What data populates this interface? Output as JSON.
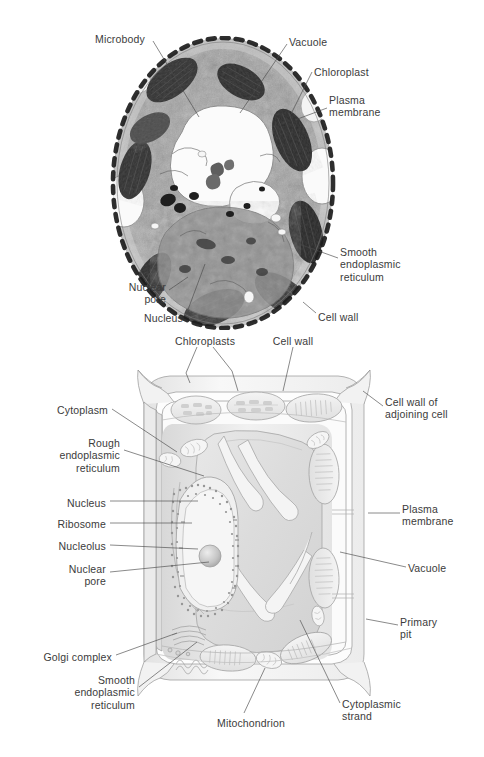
{
  "figure_top": {
    "name": "plant-cell-electron-micrograph",
    "labels": [
      {
        "id": "microbody",
        "text": "Microbody",
        "x": 95,
        "y": 33,
        "align": "left"
      },
      {
        "id": "vacuole",
        "text": "Vacuole",
        "x": 289,
        "y": 36,
        "align": "left"
      },
      {
        "id": "chloroplast",
        "text": "Chloroplast",
        "x": 314,
        "y": 66,
        "align": "left"
      },
      {
        "id": "plasma-membrane",
        "text": "Plasma\nmembrane",
        "x": 329,
        "y": 94,
        "align": "left"
      },
      {
        "id": "smooth-er",
        "text": "Smooth\nendoplasmic\nreticulum",
        "x": 340,
        "y": 246,
        "align": "left"
      },
      {
        "id": "cell-wall",
        "text": "Cell wall",
        "x": 318,
        "y": 311,
        "align": "left"
      },
      {
        "id": "nuclear-pore",
        "text": "Nuclear\npore",
        "x": 166,
        "y": 281,
        "align": "right"
      },
      {
        "id": "nucleus",
        "text": "Nucleus",
        "x": 183,
        "y": 312,
        "align": "right"
      }
    ]
  },
  "figure_bottom": {
    "name": "plant-cell-cutaway-drawing",
    "labels": [
      {
        "id": "chloroplasts",
        "text": "Chloroplasts",
        "x": 205,
        "y": 335,
        "align": "center"
      },
      {
        "id": "cell-wall-top",
        "text": "Cell wall",
        "x": 293,
        "y": 335,
        "align": "center"
      },
      {
        "id": "cytoplasm",
        "text": "Cytoplasm",
        "x": 108,
        "y": 404,
        "align": "right"
      },
      {
        "id": "rough-er",
        "text": "Rough\nendoplasmic\nreticulum",
        "x": 120,
        "y": 437,
        "align": "right"
      },
      {
        "id": "nucleus",
        "text": "Nucleus",
        "x": 106,
        "y": 497,
        "align": "right"
      },
      {
        "id": "ribosome",
        "text": "Ribosome",
        "x": 106,
        "y": 518,
        "align": "right"
      },
      {
        "id": "nucleolus",
        "text": "Nucleolus",
        "x": 106,
        "y": 540,
        "align": "right"
      },
      {
        "id": "nuclear-pore",
        "text": "Nuclear\npore",
        "x": 106,
        "y": 563,
        "align": "right"
      },
      {
        "id": "golgi-complex",
        "text": "Golgi complex",
        "x": 112,
        "y": 651,
        "align": "right"
      },
      {
        "id": "smooth-er",
        "text": "Smooth\nendoplasmic\nreticulum",
        "x": 135,
        "y": 674,
        "align": "right"
      },
      {
        "id": "mitochondrion",
        "text": "Mitochondrion",
        "x": 217,
        "y": 717,
        "align": "left"
      },
      {
        "id": "cytoplasmic-strand",
        "text": "Cytoplasmic\nstrand",
        "x": 342,
        "y": 698,
        "align": "left"
      },
      {
        "id": "cell-wall-adjoining",
        "text": "Cell wall of\nadjoining cell",
        "x": 385,
        "y": 396,
        "align": "left"
      },
      {
        "id": "plasma-membrane",
        "text": "Plasma\nmembrane",
        "x": 402,
        "y": 503,
        "align": "left"
      },
      {
        "id": "vacuole",
        "text": "Vacuole",
        "x": 408,
        "y": 562,
        "align": "left"
      },
      {
        "id": "primary-pit",
        "text": "Primary\npit",
        "x": 400,
        "y": 616,
        "align": "left"
      }
    ]
  },
  "colors": {
    "label_text": "#3b3b3b",
    "leader_line": "#4a4a4a",
    "background": "#ffffff",
    "micrograph_dark": "#1d1d1d",
    "micrograph_mid": "#8a8a8a",
    "micrograph_light": "#e9e9e9",
    "drawing_outline": "#9a9a9a",
    "drawing_fill": "#f2f2f2",
    "drawing_shade": "#dedede"
  }
}
